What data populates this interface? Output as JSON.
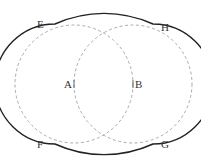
{
  "figure": {
    "labels": {
      "E": "E",
      "H": "H",
      "F": "F",
      "G": "G",
      "A": "A",
      "B": "B"
    },
    "colors": {
      "outline": "#222222",
      "dashed": "#999999",
      "text": "#333333"
    }
  }
}
